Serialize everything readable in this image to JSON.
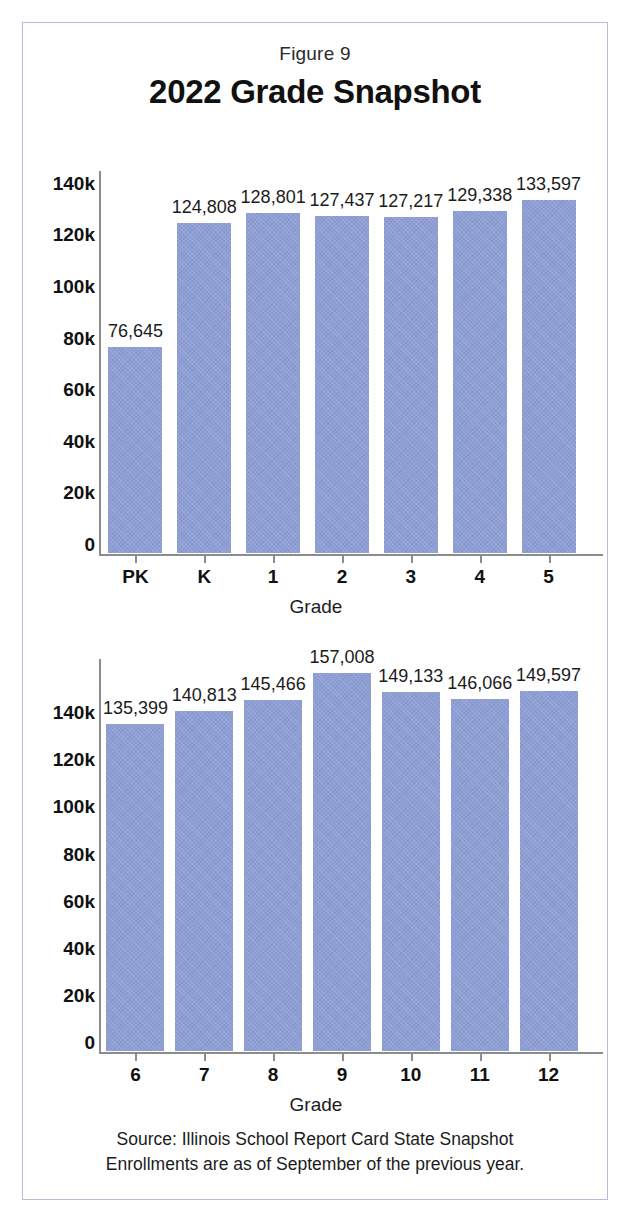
{
  "figure": {
    "number": "Figure 9",
    "title": "2022 Grade Snapshot",
    "source_line_1": "Source: Illinois School Report Card State Snapshot",
    "source_line_2": "Enrollments are as of September of the previous year.",
    "bar_color": "#8d9ed4",
    "axis_color": "#8c8c8c",
    "border_color": "#b9bcd8"
  },
  "chart_data": [
    {
      "type": "bar",
      "id": "elementary-grades",
      "title": "2022 Grade Snapshot",
      "xlabel": "Grade",
      "ylabel": "",
      "categories": [
        "PK",
        "K",
        "1",
        "2",
        "3",
        "4",
        "5"
      ],
      "values": [
        76645,
        124808,
        128801,
        127437,
        127217,
        129338,
        133597
      ],
      "value_labels": [
        "76,645",
        "124,808",
        "128,801",
        "127,437",
        "127,217",
        "129,338",
        "133,597"
      ],
      "ytick_values": [
        0,
        20000,
        40000,
        60000,
        80000,
        100000,
        120000,
        140000
      ],
      "ytick_labels": [
        "0",
        "20k",
        "40k",
        "60k",
        "80k",
        "100k",
        "120k",
        "140k"
      ],
      "ylim": [
        0,
        145000
      ],
      "grid": false,
      "legend": "none"
    },
    {
      "type": "bar",
      "id": "secondary-grades",
      "title": "2022 Grade Snapshot",
      "xlabel": "Grade",
      "ylabel": "",
      "categories": [
        "6",
        "7",
        "8",
        "9",
        "10",
        "11",
        "12"
      ],
      "values": [
        135399,
        140813,
        145466,
        157008,
        149133,
        146066,
        149597
      ],
      "value_labels": [
        "135,399",
        "140,813",
        "145,466",
        "157,008",
        "149,133",
        "146,066",
        "149,597"
      ],
      "ytick_values": [
        0,
        20000,
        40000,
        60000,
        80000,
        100000,
        120000,
        140000
      ],
      "ytick_labels": [
        "0",
        "20k",
        "40k",
        "60k",
        "80k",
        "100k",
        "120k",
        "140k"
      ],
      "ylim": [
        0,
        163000
      ],
      "grid": false,
      "legend": "none"
    }
  ]
}
